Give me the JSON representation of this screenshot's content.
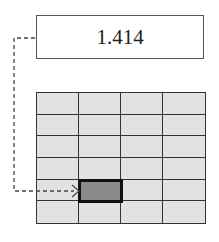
{
  "value_box": {
    "text": "1.414"
  },
  "grid": {
    "rows": 6,
    "cols": 4,
    "highlighted_cell": {
      "row": 4,
      "col": 1
    },
    "colors": {
      "cell_fill": "#e2e2e2",
      "highlight_fill": "#8a8a8a",
      "border": "#333333"
    }
  },
  "connector": {
    "style": "dashed",
    "from": "value-box-left",
    "to": "highlighted-cell-left"
  }
}
